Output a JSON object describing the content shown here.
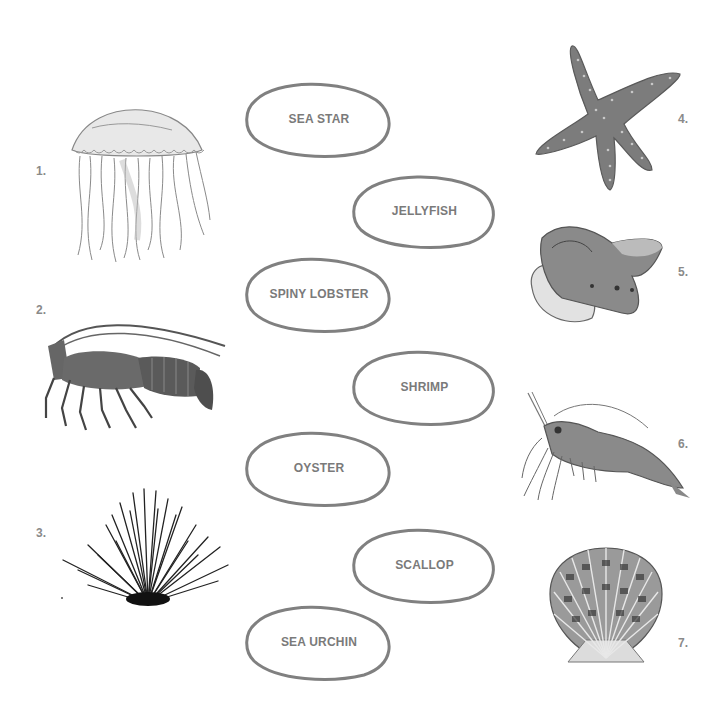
{
  "worksheet": {
    "type": "matching",
    "labels": [
      {
        "text": "SEA STAR"
      },
      {
        "text": "JELLYFISH"
      },
      {
        "text": "SPINY LOBSTER"
      },
      {
        "text": "SHRIMP"
      },
      {
        "text": "OYSTER"
      },
      {
        "text": "SCALLOP"
      },
      {
        "text": "SEA URCHIN"
      }
    ],
    "pictures": [
      {
        "number": "1.",
        "animal": "jellyfish"
      },
      {
        "number": "2.",
        "animal": "spiny-lobster"
      },
      {
        "number": "3.",
        "animal": "sea-urchin"
      },
      {
        "number": "4.",
        "animal": "sea-star"
      },
      {
        "number": "5.",
        "animal": "oyster"
      },
      {
        "number": "6.",
        "animal": "shrimp"
      },
      {
        "number": "7.",
        "animal": "scallop"
      }
    ],
    "colors": {
      "oval_stroke": "#808080",
      "label_text": "#7a7a7a",
      "number_text": "#8a8a8a"
    }
  }
}
